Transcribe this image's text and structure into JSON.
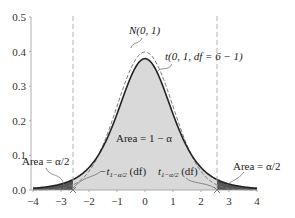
{
  "chart_data": {
    "type": "area",
    "title": "",
    "xlabel": "",
    "ylabel": "",
    "xlim": [
      -4,
      4
    ],
    "ylim": [
      0,
      0.5
    ],
    "x_ticks": [
      "−4",
      "−3",
      "−2",
      "−1",
      "0",
      "1",
      "2",
      "3",
      "4"
    ],
    "x_tick_values": [
      -4,
      -3,
      -2,
      -1,
      0,
      1,
      2,
      3,
      4
    ],
    "y_ticks": [
      "0.0",
      "0.1",
      "0.2",
      "0.3",
      "0.4",
      "0.5"
    ],
    "y_tick_values": [
      0,
      0.1,
      0.2,
      0.3,
      0.4,
      0.5
    ],
    "grid": false,
    "series": [
      {
        "name": "N(0, 1)",
        "kind": "normal",
        "mean": 0,
        "sd": 1,
        "style": "dashed"
      },
      {
        "name": "t(0, 1, df = 6 − 1)",
        "kind": "student_t",
        "df": 5,
        "style": "solid"
      }
    ],
    "critical_value": 2.571,
    "shaded_regions": [
      {
        "label": "Area = 1 − α",
        "from": -2.571,
        "to": 2.571,
        "color": "#d9d9d9"
      },
      {
        "label": "Area = α/2",
        "from": -4,
        "to": -2.571,
        "color": "#555555"
      },
      {
        "label": "Area = α/2",
        "from": 2.571,
        "to": 4,
        "color": "#555555"
      }
    ],
    "annotations": {
      "normal_label": "N(0, 1)",
      "t_label": "t(0, 1, df = 6 − 1)",
      "center_area": "Area = 1 − α",
      "left_tail_area": "Area = α/2",
      "right_tail_area": "Area = α/2",
      "left_crit_prefix": "−t",
      "left_crit_sub": "1−α/2",
      "left_crit_suffix": " (df)",
      "right_crit_prefix": "t",
      "right_crit_sub": "1−α/2",
      "right_crit_suffix": " (df)"
    }
  }
}
